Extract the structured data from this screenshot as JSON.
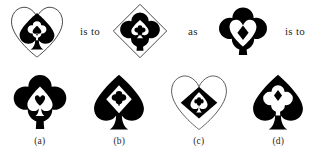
{
  "puzzle": {
    "type": "visual-analogy-multiple-choice",
    "connectors": {
      "first": "is to",
      "middle": "as",
      "second": "is to"
    },
    "colors": {
      "ink": "#000000",
      "outline": "#3a3a3a",
      "background": "#ffffff",
      "text": "#1f1f1f"
    },
    "prompt": {
      "term_a": {
        "name": "heart-outline-with-spade",
        "layers": [
          {
            "shape": "heart",
            "fill": "none",
            "stroke": "outline"
          },
          {
            "shape": "spade",
            "fill": "black"
          },
          {
            "shape": "club",
            "fill": "white"
          },
          {
            "shape": "spade",
            "fill": "black"
          }
        ]
      },
      "term_b": {
        "name": "diamond-outline-with-club",
        "layers": [
          {
            "shape": "diamond",
            "fill": "none",
            "stroke": "outline"
          },
          {
            "shape": "club",
            "fill": "black"
          },
          {
            "shape": "spade",
            "fill": "white"
          },
          {
            "shape": "club",
            "fill": "black"
          }
        ]
      },
      "term_c": {
        "name": "club-with-heart",
        "layers": [
          {
            "shape": "club",
            "fill": "black"
          },
          {
            "shape": "heart",
            "fill": "white"
          },
          {
            "shape": "diamond",
            "fill": "black"
          }
        ]
      }
    },
    "options": [
      {
        "label": "(a)",
        "name": "option-a-club-spade-heart",
        "layers": [
          {
            "shape": "club",
            "fill": "black"
          },
          {
            "shape": "spade",
            "fill": "white"
          },
          {
            "shape": "heart",
            "fill": "black"
          }
        ]
      },
      {
        "label": "(b)",
        "name": "option-b-spade-diamond-club",
        "layers": [
          {
            "shape": "spade",
            "fill": "black"
          },
          {
            "shape": "diamond",
            "fill": "white"
          },
          {
            "shape": "club",
            "fill": "black"
          }
        ]
      },
      {
        "label": "(c)",
        "name": "option-c-heart-diamond-spade",
        "layers": [
          {
            "shape": "heart",
            "fill": "none",
            "stroke": "outline"
          },
          {
            "shape": "diamond",
            "fill": "black"
          },
          {
            "shape": "spade",
            "fill": "white"
          },
          {
            "shape": "club",
            "fill": "black"
          }
        ]
      },
      {
        "label": "(d)",
        "name": "option-d-spade-club-diamond",
        "layers": [
          {
            "shape": "spade",
            "fill": "black"
          },
          {
            "shape": "club",
            "fill": "white"
          },
          {
            "shape": "diamond",
            "fill": "black"
          }
        ]
      }
    ]
  }
}
